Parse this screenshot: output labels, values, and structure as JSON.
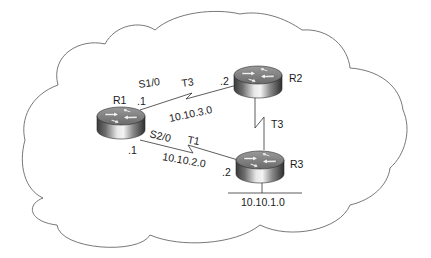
{
  "diagram": {
    "type": "network-topology",
    "cloud": {
      "stroke": "#555555"
    },
    "routers": [
      {
        "id": "R1",
        "label": "R1"
      },
      {
        "id": "R2",
        "label": "R2"
      },
      {
        "id": "R3",
        "label": "R3"
      }
    ],
    "links": [
      {
        "from": "R1",
        "to": "R2",
        "type": "serial",
        "interface": "S1/0",
        "speed": "T3",
        "network": "10.10.3.0",
        "from_host": ".1",
        "to_host": ".2"
      },
      {
        "from": "R1",
        "to": "R3",
        "type": "serial",
        "interface": "S2/0",
        "speed": "T1",
        "network": "10.10.2.0",
        "from_host": ".1",
        "to_host": ".2"
      },
      {
        "from": "R2",
        "to": "R3",
        "type": "serial",
        "speed": "T3"
      }
    ],
    "lan": {
      "router": "R3",
      "network": "10.10.1.0"
    }
  }
}
